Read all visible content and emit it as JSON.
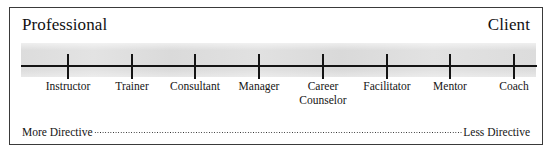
{
  "figure": {
    "endpoints": {
      "left_label": "Professional",
      "right_label": "Client"
    },
    "scale": {
      "positions_px": [
        58,
        122,
        185,
        249,
        313,
        377,
        440,
        504
      ],
      "points": [
        {
          "label": "Instructor",
          "line2": ""
        },
        {
          "label": "Trainer",
          "line2": ""
        },
        {
          "label": "Consultant",
          "line2": ""
        },
        {
          "label": "Manager",
          "line2": ""
        },
        {
          "label": "Career",
          "line2": "Counselor"
        },
        {
          "label": "Facilitator",
          "line2": ""
        },
        {
          "label": "Mentor",
          "line2": ""
        },
        {
          "label": "Coach",
          "line2": ""
        }
      ]
    },
    "directive": {
      "left_label": "More Directive",
      "right_label": "Less Directive"
    },
    "colors": {
      "band_fill": "#dcdcdc",
      "axis": "#141414",
      "border": "#3a3a3a",
      "text": "#111111",
      "background": "#ffffff"
    }
  }
}
